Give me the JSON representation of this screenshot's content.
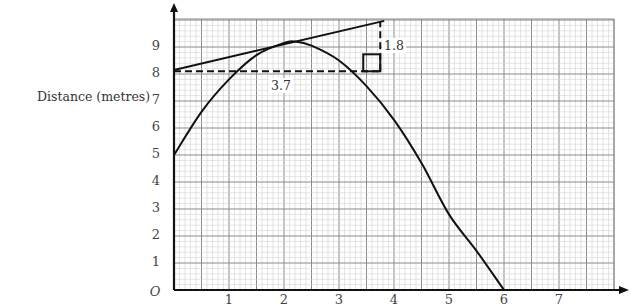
{
  "chart_data": {
    "type": "line",
    "title": "",
    "xlabel": "",
    "ylabel": "Distance (metres)",
    "origin_label": "O",
    "x_ticks": [
      "1",
      "2",
      "3",
      "4",
      "5",
      "6",
      "7"
    ],
    "y_ticks": [
      "1",
      "2",
      "3",
      "4",
      "5",
      "6",
      "7",
      "8",
      "9"
    ],
    "xlim": [
      0,
      7.8
    ],
    "ylim": [
      0,
      9.9
    ],
    "grid": true,
    "series": [
      {
        "name": "distance curve",
        "x": [
          0,
          0.5,
          1.0,
          1.5,
          2.0,
          2.2,
          2.5,
          3.0,
          3.5,
          4.0,
          4.5,
          5.0,
          5.5,
          6.0
        ],
        "y": [
          5.0,
          6.6,
          7.8,
          8.7,
          9.15,
          9.2,
          9.05,
          8.5,
          7.55,
          6.3,
          4.7,
          2.8,
          1.45,
          0.0
        ]
      },
      {
        "name": "tangent",
        "x": [
          0,
          3.75
        ],
        "y": [
          8.15,
          9.95
        ]
      }
    ],
    "annotations": [
      {
        "type": "dashed-horizontal",
        "y": 8.1,
        "x_from": 0,
        "x_to": 3.75
      },
      {
        "type": "dashed-vertical",
        "x": 3.75,
        "y_from": 8.1,
        "y_to": 9.95
      },
      {
        "type": "right-angle-box",
        "x": 3.75,
        "y": 8.1
      },
      {
        "type": "label",
        "text": "3.7",
        "note": "horizontal run"
      },
      {
        "type": "label",
        "text": "1.8",
        "note": "vertical rise"
      }
    ]
  },
  "labels": {
    "y_axis_title": "Distance (metres)",
    "origin": "O",
    "run": "3.7",
    "rise": "1.8",
    "x": [
      "1",
      "2",
      "3",
      "4",
      "5",
      "6",
      "7"
    ],
    "y": [
      "9",
      "8",
      "7",
      "6",
      "5",
      "4",
      "3",
      "2",
      "1"
    ]
  }
}
